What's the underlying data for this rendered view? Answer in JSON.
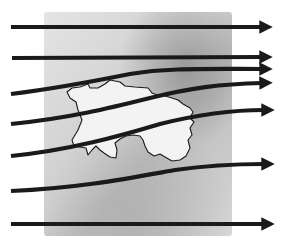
{
  "diagram": {
    "colors": {
      "background": "#ffffff",
      "panel": "#d9d9d9",
      "panel_dark": "#9a9a9a",
      "island_fill": "#f2f2f2",
      "island_outline": "#1a1a1a",
      "arrow": "#1a1a1a"
    },
    "streamlines": [
      {
        "id": "line-1",
        "shape": "straight"
      },
      {
        "id": "line-2",
        "shape": "straight"
      },
      {
        "id": "line-3",
        "shape": "curved-up-converging"
      },
      {
        "id": "line-4",
        "shape": "curved-up"
      },
      {
        "id": "line-5",
        "shape": "curved-up"
      },
      {
        "id": "line-6",
        "shape": "curved-up"
      },
      {
        "id": "line-7",
        "shape": "straight"
      }
    ],
    "island": {
      "label": "island-outline"
    }
  }
}
